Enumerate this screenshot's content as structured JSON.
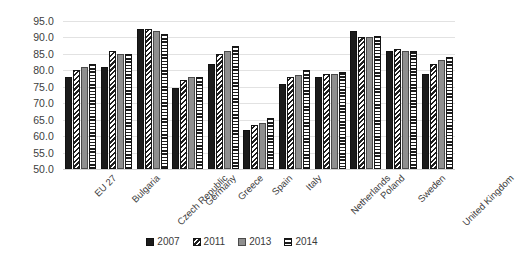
{
  "chart_data": {
    "type": "bar",
    "title": "",
    "subtitle": "",
    "xlabel": "",
    "ylabel": "",
    "ylim": [
      50.0,
      95.0
    ],
    "ytick_step": 5.0,
    "ytick_labels": [
      "95.0",
      "90.0",
      "85.0",
      "80.0",
      "75.0",
      "70.0",
      "65.0",
      "60.0",
      "55.0",
      "50.0"
    ],
    "ytick_values": [
      95.0,
      90.0,
      85.0,
      80.0,
      75.0,
      70.0,
      65.0,
      60.0,
      55.0,
      50.0
    ],
    "grid": true,
    "grid_axis": "y",
    "legend_position": "bottom",
    "categories": [
      "EU 27",
      "Bulgaria",
      "Czech Republic",
      "Germany",
      "Greece",
      "Spain",
      "Italy",
      "Netherlands",
      "Poland",
      "Sweden",
      "United Kingdom"
    ],
    "series": [
      {
        "name": "2007",
        "pattern": "solid-black",
        "values": [
          78.0,
          81.0,
          92.5,
          74.5,
          82.0,
          62.0,
          76.0,
          78.0,
          92.0,
          86.0,
          79.0
        ]
      },
      {
        "name": "2011",
        "pattern": "diagonal-hatch",
        "values": [
          80.0,
          86.0,
          92.5,
          77.0,
          85.0,
          63.5,
          78.0,
          79.0,
          90.0,
          86.5,
          82.0
        ]
      },
      {
        "name": "2013",
        "pattern": "solid-gray",
        "values": [
          81.0,
          85.0,
          92.0,
          78.0,
          86.0,
          64.0,
          78.5,
          79.0,
          90.0,
          86.0,
          83.0
        ]
      },
      {
        "name": "2014",
        "pattern": "horizontal-hatch",
        "values": [
          82.0,
          85.0,
          91.0,
          78.0,
          87.5,
          65.5,
          80.0,
          79.5,
          90.5,
          86.0,
          84.0
        ]
      }
    ]
  },
  "legend": {
    "entries": [
      {
        "label": "2007",
        "pattern": "solid-black"
      },
      {
        "label": "2011",
        "pattern": "diagonal-hatch"
      },
      {
        "label": "2013",
        "pattern": "solid-gray"
      },
      {
        "label": "2014",
        "pattern": "horizontal-hatch"
      }
    ]
  },
  "colors": {
    "series_2007": "#1b1b1b",
    "series_2011": "#1f1f1f",
    "series_2013": "#8f8f8f",
    "series_2014": "#1c1c1c",
    "gridline": "#e2e2e2",
    "background": "#ffffff",
    "text": "#3f3f3f"
  }
}
